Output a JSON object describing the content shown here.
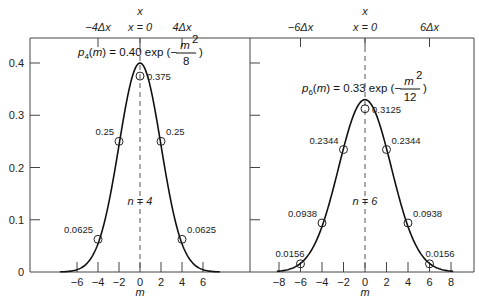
{
  "chart_data": [
    {
      "type": "line",
      "panel": "left",
      "n_label": "n = 4",
      "formula": {
        "lhs": "p",
        "sub": "4",
        "arg": "(m) = 0.40 exp",
        "num": "m",
        "den": "8"
      },
      "xlabel": "m",
      "top_xlabel": "x",
      "top_ticks": [
        "−4Δx",
        "x = 0",
        "4Δx"
      ],
      "top_tick_m": [
        -4,
        0,
        4
      ],
      "xticks": [
        -6,
        -4,
        -2,
        0,
        2,
        4,
        6
      ],
      "yticks": [
        0,
        0.1,
        0.2,
        0.3,
        0.4
      ],
      "ylim": [
        0,
        0.4
      ],
      "curve": {
        "amplitude": 0.4,
        "divisor": 8
      },
      "points": [
        {
          "m": -4,
          "p": 0.0625,
          "label": "0.0625"
        },
        {
          "m": -2,
          "p": 0.25,
          "label": "0.25"
        },
        {
          "m": 0,
          "p": 0.375,
          "label": "0.375"
        },
        {
          "m": 2,
          "p": 0.25,
          "label": "0.25"
        },
        {
          "m": 4,
          "p": 0.0625,
          "label": "0.0625"
        }
      ]
    },
    {
      "type": "line",
      "panel": "right",
      "n_label": "n = 6",
      "formula": {
        "lhs": "p",
        "sub": "6",
        "arg": "(m) = 0.33 exp",
        "num": "m",
        "den": "12"
      },
      "xlabel": "m",
      "top_xlabel": "x",
      "top_ticks": [
        "−6Δx",
        "x = 0",
        "6Δx"
      ],
      "top_tick_m": [
        -6,
        0,
        6
      ],
      "xticks": [
        -8,
        -6,
        -4,
        -2,
        0,
        2,
        4,
        6,
        8
      ],
      "ylim": [
        0,
        0.4
      ],
      "curve": {
        "amplitude": 0.33,
        "divisor": 12
      },
      "points": [
        {
          "m": -6,
          "p": 0.0156,
          "label": "0.0156"
        },
        {
          "m": -4,
          "p": 0.0938,
          "label": "0.0938"
        },
        {
          "m": -2,
          "p": 0.2344,
          "label": "0.2344"
        },
        {
          "m": 0,
          "p": 0.3125,
          "label": "0.3125"
        },
        {
          "m": 2,
          "p": 0.2344,
          "label": "0.2344"
        },
        {
          "m": 4,
          "p": 0.0938,
          "label": "0.0938"
        },
        {
          "m": 6,
          "p": 0.0156,
          "label": "0.0156"
        }
      ]
    }
  ]
}
